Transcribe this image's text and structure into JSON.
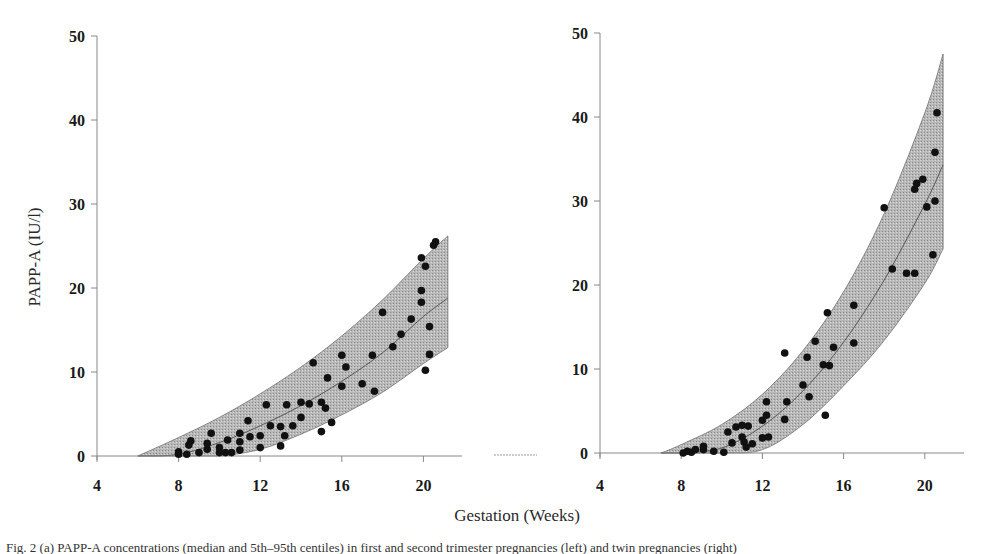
{
  "figure": {
    "ylabel": "PAPP-A (IU/l)",
    "xlabel": "Gestation (Weeks)",
    "colors": {
      "band_fill": "#b8b8b8",
      "band_edge": "#707070",
      "point": "#111111",
      "axis": "#888888",
      "median": "#555555"
    }
  },
  "chart_data": [
    {
      "type": "scatter",
      "panel": "left",
      "title": "",
      "xlabel": "Gestation (Weeks)",
      "ylabel": "PAPP-A (IU/l)",
      "xlim": [
        4,
        22
      ],
      "ylim": [
        0,
        50
      ],
      "xticks": [
        4,
        8,
        12,
        16,
        20
      ],
      "yticks": [
        0,
        10,
        20,
        30,
        40,
        50
      ],
      "grid": false,
      "reference_band": {
        "x": [
          6.0,
          8,
          10,
          12,
          14,
          16,
          18,
          20,
          21.2
        ],
        "upper": [
          0,
          2.2,
          4.6,
          7.4,
          10.6,
          14.3,
          18.6,
          23.5,
          26.2
        ],
        "median": [
          0,
          0.2,
          1.6,
          3.6,
          6.0,
          8.9,
          12.3,
          16.6,
          18.8
        ],
        "lower": [
          0,
          0,
          0,
          0.8,
          2.6,
          4.9,
          7.6,
          11.0,
          12.9
        ]
      },
      "points": [
        [
          8.0,
          0.5
        ],
        [
          8.0,
          0.2
        ],
        [
          8.4,
          0.2
        ],
        [
          8.5,
          1.3
        ],
        [
          8.6,
          1.8
        ],
        [
          9.0,
          0.4
        ],
        [
          9.4,
          0.8
        ],
        [
          9.4,
          1.5
        ],
        [
          9.6,
          2.7
        ],
        [
          10.0,
          0.4
        ],
        [
          10.0,
          1.0
        ],
        [
          10.3,
          0.4
        ],
        [
          10.4,
          1.9
        ],
        [
          10.6,
          0.4
        ],
        [
          11.0,
          0.7
        ],
        [
          11.0,
          1.7
        ],
        [
          11.0,
          2.7
        ],
        [
          11.4,
          4.2
        ],
        [
          11.5,
          2.3
        ],
        [
          12.0,
          1.0
        ],
        [
          12.0,
          2.4
        ],
        [
          12.3,
          6.1
        ],
        [
          12.5,
          3.6
        ],
        [
          13.0,
          1.2
        ],
        [
          13.0,
          3.5
        ],
        [
          13.2,
          2.4
        ],
        [
          13.3,
          6.1
        ],
        [
          13.6,
          3.6
        ],
        [
          14.0,
          4.6
        ],
        [
          14.0,
          6.4
        ],
        [
          14.4,
          6.2
        ],
        [
          14.6,
          11.1
        ],
        [
          15.0,
          2.9
        ],
        [
          15.0,
          6.4
        ],
        [
          15.2,
          5.7
        ],
        [
          15.3,
          9.3
        ],
        [
          15.5,
          4.0
        ],
        [
          16.0,
          8.3
        ],
        [
          16.0,
          12.0
        ],
        [
          16.2,
          10.6
        ],
        [
          17.0,
          8.6
        ],
        [
          17.5,
          12.0
        ],
        [
          17.6,
          7.7
        ],
        [
          18.0,
          17.1
        ],
        [
          18.5,
          13.0
        ],
        [
          18.9,
          14.5
        ],
        [
          19.4,
          16.3
        ],
        [
          19.9,
          18.3
        ],
        [
          19.9,
          19.7
        ],
        [
          19.9,
          23.6
        ],
        [
          20.1,
          22.6
        ],
        [
          20.1,
          10.2
        ],
        [
          20.3,
          12.1
        ],
        [
          20.3,
          15.4
        ],
        [
          20.5,
          25.1
        ],
        [
          20.6,
          25.5
        ]
      ]
    },
    {
      "type": "scatter",
      "panel": "right",
      "title": "",
      "xlabel": "Gestation (Weeks)",
      "ylabel": "PAPP-A (IU/l)",
      "xlim": [
        4,
        22
      ],
      "ylim": [
        0,
        50
      ],
      "xticks": [
        4,
        8,
        12,
        16,
        20
      ],
      "yticks": [
        0,
        10,
        20,
        30,
        40,
        50
      ],
      "grid": false,
      "reference_band": {
        "x": [
          7.0,
          8,
          10,
          12,
          14,
          16,
          18,
          20,
          20.9
        ],
        "upper": [
          0,
          1.0,
          3.4,
          7.0,
          12.2,
          19.2,
          28.5,
          40.5,
          47.5
        ],
        "median": [
          0,
          0,
          0.6,
          3.2,
          7.4,
          13.2,
          20.6,
          29.6,
          34.3
        ],
        "lower": [
          0,
          0,
          0,
          0.4,
          3.4,
          8.0,
          13.4,
          20.2,
          24.3
        ]
      },
      "points": [
        [
          8.1,
          0.0
        ],
        [
          8.3,
          0.2
        ],
        [
          8.5,
          0.1
        ],
        [
          8.7,
          0.4
        ],
        [
          9.1,
          0.4
        ],
        [
          9.1,
          0.8
        ],
        [
          9.6,
          0.2
        ],
        [
          10.1,
          0.1
        ],
        [
          10.3,
          2.5
        ],
        [
          10.5,
          1.2
        ],
        [
          10.7,
          3.1
        ],
        [
          11.0,
          1.9
        ],
        [
          11.0,
          3.3
        ],
        [
          11.1,
          1.3
        ],
        [
          11.2,
          0.7
        ],
        [
          11.3,
          3.2
        ],
        [
          11.5,
          1.1
        ],
        [
          12.0,
          1.8
        ],
        [
          12.0,
          3.9
        ],
        [
          12.2,
          4.5
        ],
        [
          12.2,
          6.1
        ],
        [
          12.3,
          1.9
        ],
        [
          13.1,
          4.0
        ],
        [
          13.1,
          11.9
        ],
        [
          13.2,
          6.1
        ],
        [
          14.0,
          8.1
        ],
        [
          14.2,
          11.4
        ],
        [
          14.3,
          6.7
        ],
        [
          14.6,
          13.3
        ],
        [
          15.0,
          10.5
        ],
        [
          15.1,
          4.5
        ],
        [
          15.2,
          16.7
        ],
        [
          15.3,
          10.4
        ],
        [
          15.5,
          12.6
        ],
        [
          16.5,
          13.1
        ],
        [
          16.5,
          17.6
        ],
        [
          18.0,
          29.2
        ],
        [
          18.4,
          21.9
        ],
        [
          19.1,
          21.4
        ],
        [
          19.5,
          21.4
        ],
        [
          19.5,
          31.4
        ],
        [
          19.6,
          32.1
        ],
        [
          19.9,
          32.6
        ],
        [
          20.1,
          29.3
        ],
        [
          20.4,
          23.6
        ],
        [
          20.5,
          30.0
        ],
        [
          20.5,
          35.8
        ],
        [
          20.6,
          40.5
        ]
      ]
    }
  ],
  "caption": "Fig. 2 (a) PAPP-A concentrations (median and 5th–95th centiles) in first and second trimester pregnancies (left) and twin pregnancies (right)"
}
